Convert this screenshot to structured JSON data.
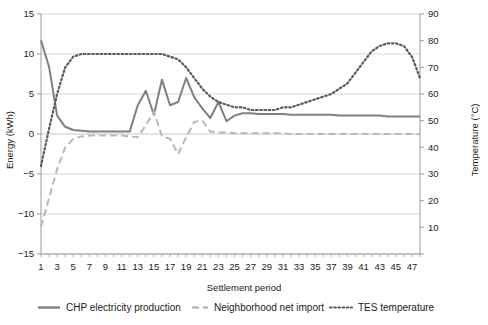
{
  "chart_data": {
    "type": "line",
    "title": "",
    "xlabel": "Settlement period",
    "ylabel": "Energy (kWh)",
    "y2label": "Temperature (°C)",
    "xlim": [
      1,
      48
    ],
    "ylim": [
      -15,
      15
    ],
    "y2lim": [
      0,
      90
    ],
    "grid": true,
    "legend_position": "bottom",
    "x": [
      1,
      2,
      3,
      4,
      5,
      6,
      7,
      8,
      9,
      10,
      11,
      12,
      13,
      14,
      15,
      16,
      17,
      18,
      19,
      20,
      21,
      22,
      23,
      24,
      25,
      26,
      27,
      28,
      29,
      30,
      31,
      32,
      33,
      34,
      35,
      36,
      37,
      38,
      39,
      40,
      41,
      42,
      43,
      44,
      45,
      46,
      47,
      48
    ],
    "xticks": [
      1,
      3,
      5,
      7,
      9,
      11,
      13,
      15,
      17,
      19,
      21,
      23,
      25,
      27,
      29,
      31,
      33,
      35,
      37,
      39,
      41,
      43,
      45,
      47
    ],
    "yticks": [
      -15,
      -10,
      -5,
      0,
      5,
      10,
      15
    ],
    "y2ticks": [
      0,
      10,
      20,
      30,
      40,
      50,
      60,
      70,
      80,
      90
    ],
    "series": [
      {
        "name": "CHP electricity production",
        "axis": "left",
        "style": "solid",
        "color": "#808080",
        "values": [
          11.7,
          8.4,
          2.3,
          0.9,
          0.5,
          0.4,
          0.3,
          0.3,
          0.3,
          0.3,
          0.3,
          0.3,
          3.6,
          5.4,
          2.4,
          6.8,
          3.6,
          4.0,
          7.0,
          4.6,
          3.2,
          2.0,
          4.0,
          1.6,
          2.3,
          2.6,
          2.6,
          2.5,
          2.5,
          2.5,
          2.5,
          2.4,
          2.4,
          2.4,
          2.4,
          2.4,
          2.4,
          2.3,
          2.3,
          2.3,
          2.3,
          2.3,
          2.3,
          2.2,
          2.2,
          2.2,
          2.2,
          2.2
        ]
      },
      {
        "name": "Neighborhood net import",
        "axis": "left",
        "style": "dashed",
        "color": "#b8b8b8",
        "values": [
          -11.6,
          -8.0,
          -4.4,
          -1.7,
          -0.6,
          -0.3,
          -0.2,
          -0.2,
          -0.2,
          -0.2,
          -0.2,
          -0.3,
          -0.4,
          1.1,
          2.8,
          -0.3,
          -0.6,
          -2.5,
          -0.4,
          1.5,
          1.7,
          0.3,
          0.2,
          0.2,
          0.1,
          0.1,
          0.1,
          0.1,
          0.1,
          0.1,
          0.1,
          0.0,
          0.0,
          0.0,
          0.0,
          0.0,
          0.0,
          0.0,
          0.0,
          0.0,
          0.0,
          0.0,
          0.0,
          0.0,
          0.0,
          0.0,
          0.0,
          0.0
        ]
      },
      {
        "name": "TES temperature",
        "axis": "right",
        "style": "dotted",
        "color": "#595959",
        "values": [
          33,
          47,
          60,
          70,
          74,
          75,
          75,
          75,
          75,
          75,
          75,
          75,
          75,
          75,
          75,
          75,
          74,
          73,
          70,
          66,
          62,
          59,
          57,
          56,
          55,
          55,
          54,
          54,
          54,
          54,
          55,
          55,
          56,
          57,
          58,
          59,
          60,
          62,
          64,
          68,
          72,
          76,
          78,
          79,
          79,
          78,
          74,
          66
        ]
      }
    ],
    "series_detail": {
      "note_left_axis_values": "Left axis kWh; right axis °C",
      "chp_annotations": [
        "start peak 11.7 at period 1",
        "local peaks ~7 at period 16 and 19",
        "max ~10 at period 35"
      ],
      "import_annotations": [
        "min -11.6 at period 1",
        "rises to ~0 by period 6",
        "dip to -6.5 near period 35"
      ]
    }
  },
  "legend": {
    "items": [
      {
        "label": "CHP electricity production",
        "style": "solid",
        "color": "#808080"
      },
      {
        "label": "Neighborhood net import",
        "style": "dashed",
        "color": "#b8b8b8"
      },
      {
        "label": "TES temperature",
        "style": "dotted",
        "color": "#595959"
      }
    ]
  },
  "axes": {
    "y_label": "Energy (kWh)",
    "y2_label": "Temperature (°C)",
    "x_label": "Settlement period"
  }
}
